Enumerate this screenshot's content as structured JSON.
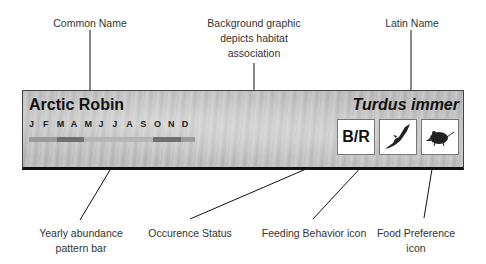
{
  "annotations": {
    "common_name": "Common Name",
    "background": [
      "Background graphic",
      "depicts habitat",
      "association"
    ],
    "latin_name": "Latin Name",
    "abundance_bar": [
      "Yearly abundance",
      "pattern bar"
    ],
    "occurrence": "Occurence Status",
    "feeding": "Feeding Behavior icon",
    "food": [
      "Food Preference",
      "icon"
    ]
  },
  "card": {
    "common_name": "Arctic Robin",
    "latin_name": "Turdus immer",
    "months": [
      "J",
      "F",
      "M",
      "A",
      "M",
      "J",
      "J",
      "A",
      "S",
      "O",
      "N",
      "D"
    ],
    "abundance": [
      "low",
      "low",
      "medium",
      "medium",
      "high",
      "high",
      "high",
      "high",
      "high",
      "medium",
      "medium",
      "low"
    ],
    "abundance_colors": {
      "low": "#9a9a9a",
      "medium": "#6f6f6f",
      "high": "#b5b5b5"
    },
    "occurrence_status": "B/R",
    "feeding_icon": "bird-in-flight-icon",
    "food_icon": "rodent-icon"
  }
}
